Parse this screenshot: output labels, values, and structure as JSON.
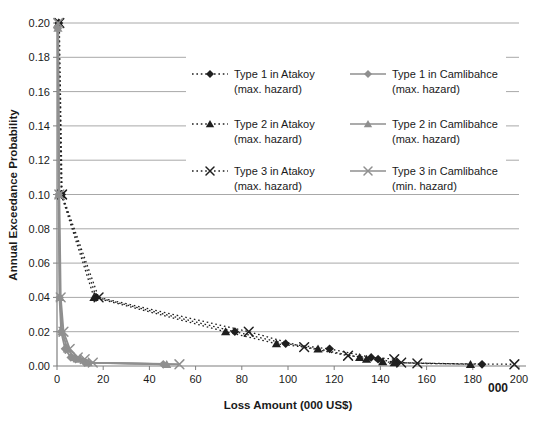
{
  "figure": {
    "y_axis_title": "Annual Exceedance Probability",
    "x_axis_title": "Loss Amount (000 US$)",
    "axis_note": "000",
    "background": "#ffffff"
  },
  "legend": {
    "items": [
      {
        "name": "Type 1 in Atakoy",
        "qualifier": "(max. hazard)",
        "marker": "diamond",
        "line": "dotted",
        "color": "#1f1f1f"
      },
      {
        "name": "Type 2 in Atakoy",
        "qualifier": "(max. hazard)",
        "marker": "triangle",
        "line": "dotted",
        "color": "#1f1f1f"
      },
      {
        "name": "Type 3 in Atakoy",
        "qualifier": "(max. hazard)",
        "marker": "x",
        "line": "dotted",
        "color": "#1f1f1f"
      },
      {
        "name": "Type 1 in Camlibahce",
        "qualifier": "(max. hazard)",
        "marker": "diamond",
        "line": "solid",
        "color": "#8f8f8f"
      },
      {
        "name": "Type 2 in Camlibahce",
        "qualifier": "(max. hazard)",
        "marker": "triangle",
        "line": "solid",
        "color": "#8f8f8f"
      },
      {
        "name": "Type 3 in Camlibahce",
        "qualifier": "(min. hazard)",
        "marker": "x",
        "line": "solid",
        "color": "#8f8f8f"
      }
    ]
  },
  "chart_data": {
    "type": "line",
    "title": "",
    "xlabel": "Loss Amount (000 US$)",
    "ylabel": "Annual Exceedance Probability",
    "xlim": [
      0,
      200
    ],
    "ylim": [
      0,
      0.2
    ],
    "x_ticks": [
      0,
      20,
      40,
      60,
      80,
      100,
      120,
      140,
      160,
      180,
      200
    ],
    "y_ticks": [
      0,
      0.02,
      0.04,
      0.06,
      0.08,
      0.1,
      0.12,
      0.14,
      0.16,
      0.18,
      0.2
    ],
    "grid": "horizontal-only",
    "legend_position": "inside-top-center",
    "grid_color": "#a8a8a8",
    "axis_color": "#7f7f7f",
    "text_color": "#1a1a1a",
    "series": [
      {
        "name": "Type 1 in Atakoy (max. hazard)",
        "marker": "diamond",
        "line": "dotted",
        "color": "#1f1f1f",
        "points": [
          [
            0.8,
            0.2
          ],
          [
            2,
            0.1
          ],
          [
            17,
            0.04
          ],
          [
            77,
            0.02
          ],
          [
            99,
            0.013
          ],
          [
            118,
            0.01
          ],
          [
            136,
            0.005
          ],
          [
            139,
            0.004
          ],
          [
            147,
            0.002
          ],
          [
            184,
            0.001
          ]
        ]
      },
      {
        "name": "Type 2 in Atakoy (max. hazard)",
        "marker": "triangle",
        "line": "dotted",
        "color": "#1f1f1f",
        "points": [
          [
            0.7,
            0.2
          ],
          [
            1.8,
            0.1
          ],
          [
            16,
            0.04
          ],
          [
            73,
            0.02
          ],
          [
            95,
            0.013
          ],
          [
            113,
            0.01
          ],
          [
            131,
            0.005
          ],
          [
            134,
            0.004
          ],
          [
            141,
            0.0025
          ],
          [
            146,
            0.002
          ],
          [
            179,
            0.001
          ]
        ]
      },
      {
        "name": "Type 3 in Atakoy (max. hazard)",
        "marker": "x",
        "line": "dotted",
        "color": "#1f1f1f",
        "points": [
          [
            1,
            0.2
          ],
          [
            2.2,
            0.1
          ],
          [
            18,
            0.04
          ],
          [
            83,
            0.02
          ],
          [
            107,
            0.011
          ],
          [
            126,
            0.006
          ],
          [
            146,
            0.004
          ],
          [
            149,
            0.002
          ],
          [
            156,
            0.0015
          ],
          [
            198,
            0.001
          ]
        ]
      },
      {
        "name": "Type 1 in Camlibahce (max. hazard)",
        "marker": "diamond",
        "line": "solid",
        "color": "#8f8f8f",
        "points": [
          [
            0.3,
            0.197
          ],
          [
            0.7,
            0.1
          ],
          [
            1.1,
            0.04
          ],
          [
            1.8,
            0.02
          ],
          [
            3.5,
            0.01
          ],
          [
            6,
            0.005
          ],
          [
            8,
            0.004
          ],
          [
            12,
            0.002
          ],
          [
            46,
            0.001
          ]
        ]
      },
      {
        "name": "Type 2 in Camlibahce (max. hazard)",
        "marker": "triangle",
        "line": "solid",
        "color": "#8f8f8f",
        "points": [
          [
            0.4,
            0.197
          ],
          [
            0.8,
            0.1
          ],
          [
            1.3,
            0.04
          ],
          [
            2.2,
            0.02
          ],
          [
            4.5,
            0.01
          ],
          [
            7.5,
            0.005
          ],
          [
            10,
            0.004
          ],
          [
            13.5,
            0.002
          ],
          [
            47.5,
            0.001
          ]
        ]
      },
      {
        "name": "Type 3 in Camlibahce (min. hazard)",
        "marker": "x",
        "line": "solid",
        "color": "#8f8f8f",
        "points": [
          [
            0.5,
            0.2
          ],
          [
            1,
            0.1
          ],
          [
            1.6,
            0.04
          ],
          [
            2.8,
            0.02
          ],
          [
            5.5,
            0.01
          ],
          [
            9,
            0.005
          ],
          [
            12,
            0.004
          ],
          [
            15.5,
            0.002
          ],
          [
            53,
            0.001
          ]
        ]
      }
    ]
  }
}
